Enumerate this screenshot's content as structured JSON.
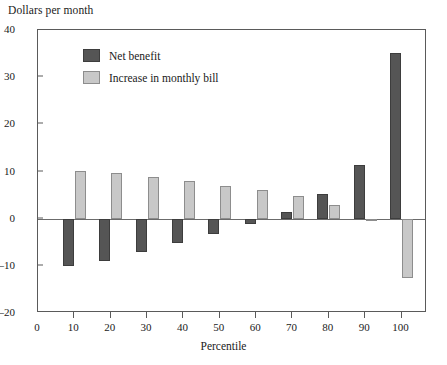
{
  "chart_data": {
    "type": "bar",
    "title": "Dollars per month",
    "xlabel": "Percentile",
    "ylabel": "",
    "categories": [
      "10",
      "20",
      "30",
      "40",
      "50",
      "60",
      "70",
      "80",
      "90",
      "100"
    ],
    "x": [
      10,
      20,
      30,
      40,
      50,
      60,
      70,
      80,
      90,
      100
    ],
    "series": [
      {
        "name": "Net benefit",
        "color": "#555555",
        "values": [
          -10.0,
          -9.0,
          -7.0,
          -5.2,
          -3.2,
          -1.2,
          1.5,
          5.2,
          11.3,
          35.2
        ]
      },
      {
        "name": "Increase in monthly bill",
        "color": "#c8c8c8",
        "values": [
          10.2,
          9.7,
          8.9,
          7.9,
          6.9,
          6.1,
          4.7,
          2.8,
          -0.4,
          -12.5
        ]
      }
    ],
    "ylim": [
      -20,
      40
    ],
    "yticks": [
      40,
      30,
      20,
      10,
      0,
      -10,
      -20
    ],
    "ytick_labels": [
      "40",
      "30",
      "20",
      "10",
      "0",
      "–10",
      "–20"
    ],
    "xlim": [
      0,
      107
    ],
    "xticks": [
      0,
      10,
      20,
      30,
      40,
      50,
      60,
      70,
      80,
      90,
      100
    ],
    "xtick_labels": [
      "0",
      "10",
      "20",
      "30",
      "40",
      "50",
      "60",
      "70",
      "80",
      "90",
      "100"
    ],
    "grid": false,
    "zero_line": true,
    "legend_position": "upper-left-inside"
  }
}
